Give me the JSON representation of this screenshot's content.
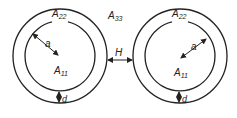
{
  "diagram": {
    "labels": {
      "outer_region": "A",
      "outer_region_sub": "33",
      "ring_region": "A",
      "ring_region_sub": "22",
      "inner_region": "A",
      "inner_region_sub": "11",
      "radius": "a",
      "thickness": "d",
      "gap": "H"
    },
    "stroke_color": "#222222",
    "background": "#ffffff"
  }
}
